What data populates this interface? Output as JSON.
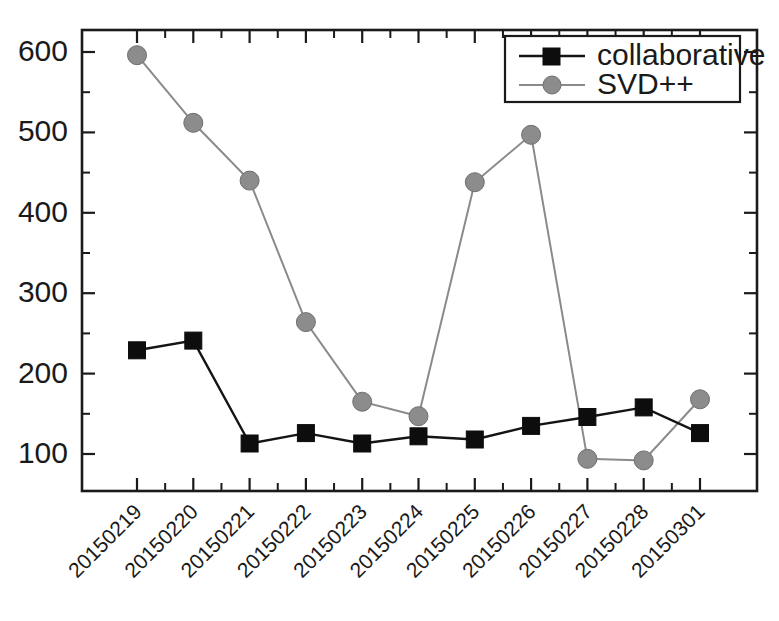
{
  "chart_data": {
    "type": "line",
    "title": "",
    "xlabel": "",
    "ylabel": "",
    "categories": [
      "20150219",
      "20150220",
      "20150221",
      "20150222",
      "20150223",
      "20150224",
      "20150225",
      "20150226",
      "20150227",
      "20150228",
      "20150301"
    ],
    "series": [
      {
        "name": "collaborative",
        "marker": "square",
        "color": "#0d0d0d",
        "values": [
          229,
          241,
          113,
          126,
          113,
          122,
          118,
          135,
          146,
          158,
          126
        ]
      },
      {
        "name": "SVD++",
        "marker": "circle",
        "color": "#8c8c8c",
        "values": [
          596,
          512,
          440,
          264,
          165,
          147,
          438,
          497,
          94,
          92,
          168
        ]
      }
    ],
    "ylim": [
      60,
      645
    ],
    "ytick_labels": [
      "100",
      "200",
      "300",
      "400",
      "500",
      "600"
    ],
    "ytick_values": [
      100,
      200,
      300,
      400,
      500,
      600
    ],
    "yminor_values": [
      150,
      250,
      350,
      450,
      550
    ],
    "grid": false,
    "legend_position": "top-right",
    "legend_entries": [
      "collaborative",
      "SVD++"
    ],
    "xtick_rotation": 45
  },
  "axes": {
    "frame_color": "#1a1a1a",
    "background": "#ffffff"
  }
}
